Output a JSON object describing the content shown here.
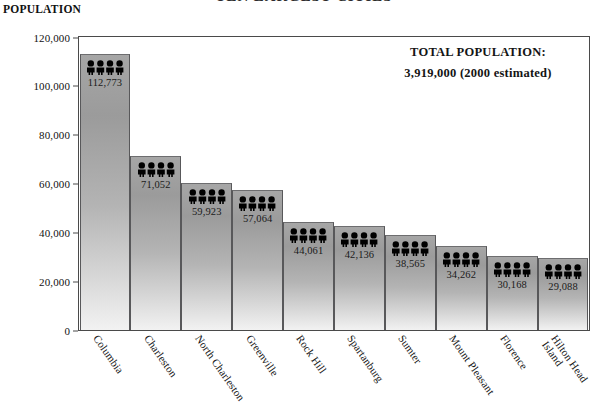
{
  "chart_data": {
    "type": "bar",
    "title": "TEN LARGEST CITIES",
    "ylabel": "POPULATION",
    "xlabel": "",
    "ylim": [
      0,
      120000
    ],
    "ytick_values": [
      0,
      20000,
      40000,
      60000,
      80000,
      100000,
      120000
    ],
    "ytick_labels": [
      "0",
      "20,000",
      "40,000",
      "60,000",
      "80,000",
      "100,000",
      "120,000"
    ],
    "grid": false,
    "legend": "none",
    "categories": [
      "Columbia",
      "Charleston",
      "North Charleston",
      "Greenville",
      "Rock Hill",
      "Spartanburg",
      "Sumter",
      "Mount Pleasant",
      "Florence",
      "Hilton Head Island"
    ],
    "category_lines": [
      [
        "Columbia"
      ],
      [
        "Charleston"
      ],
      [
        "North Charleston"
      ],
      [
        "Greenville"
      ],
      [
        "Rock Hill"
      ],
      [
        "Spartanburg"
      ],
      [
        "Sumter"
      ],
      [
        "Mount Pleasant"
      ],
      [
        "Florence"
      ],
      [
        "Hilton Head",
        "Island"
      ]
    ],
    "values": [
      112773,
      71052,
      59923,
      57064,
      44061,
      42136,
      38565,
      34262,
      30168,
      29088
    ],
    "value_labels": [
      "112,773",
      "71,052",
      "59,923",
      "57,064",
      "44,061",
      "42,136",
      "38,565",
      "34,262",
      "30,168",
      "29,088"
    ],
    "bar_pictogram": "person-icon",
    "pictograms_per_bar": 4,
    "annotations": {
      "total_label": "TOTAL POPULATION:",
      "total_value": "3,919,000  (2000 estimated)"
    },
    "colors": {
      "bar_top": "#a6a6a6",
      "bar_bottom": "#f2f2f2",
      "frame": "#4a4a4a",
      "text": "#141414"
    }
  }
}
